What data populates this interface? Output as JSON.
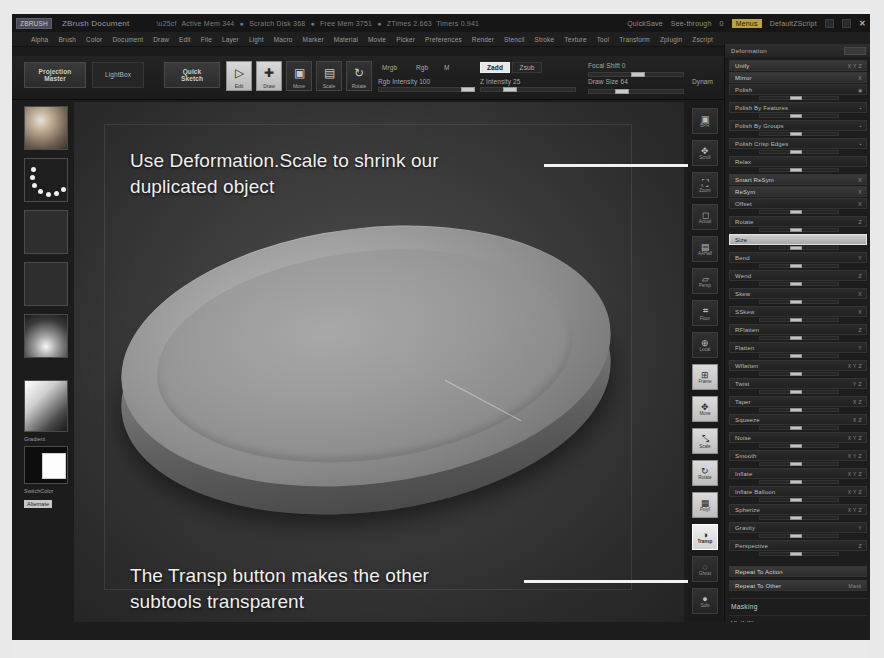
{
  "titlebar": {
    "badge": "ZBRUSH",
    "document": "ZBrush Document",
    "stats": [
      {
        "label": "Active Mem",
        "value": "344"
      },
      {
        "label": "Scratch Disk",
        "value": "368"
      },
      {
        "label": "Free Mem",
        "value": "3751"
      },
      {
        "label": "ZTimes",
        "value": "2.663"
      },
      {
        "label": "Timers",
        "value": "0.941"
      }
    ],
    "quicksave": "QuickSave",
    "see_through": "See-through",
    "see_through_value": "0",
    "menus_button": "Menus",
    "default_zscript": "DefaultZScript",
    "close": "✕"
  },
  "menubar": {
    "items": [
      "Alpha",
      "Brush",
      "Color",
      "Document",
      "Draw",
      "Edit",
      "File",
      "Layer",
      "Light",
      "Macro",
      "Marker",
      "Material",
      "Movie",
      "Picker",
      "Preferences",
      "Render",
      "Stencil",
      "Stroke",
      "Texture",
      "Tool",
      "Transform",
      "Zplugin",
      "Zscript"
    ],
    "subrow": "Size"
  },
  "toolbar": {
    "projection_master": "Projection\nMaster",
    "lightbox": "LightBox",
    "quick_sketch": "Quick\nSketch",
    "edit": "Edit",
    "draw": "Draw",
    "move": "Move",
    "scale": "Scale",
    "rotate": "Rotate",
    "mrgb": "Mrgb",
    "rgb": "Rgb",
    "m": "M",
    "zadd": "Zadd",
    "zsub": "Zsub",
    "rgb_intensity": "Rgb Intensity 100",
    "z_intensity": "Z Intensity 25",
    "focal_shift": "Focal Shift 0",
    "draw_size": "Draw Size 64",
    "dynamic": "Dynam",
    "active_points": "ActivePoints 1",
    "total_points": "TotalPoints 21"
  },
  "shelf": {
    "brush_label": "Standard",
    "stroke_label": "Dots",
    "alpha_label": "Alpha Off",
    "texture_label": "Texture Off",
    "material_label": "SkinShade4",
    "gradient_label": "Gradient",
    "switch_color_label": "SwitchColor",
    "alternate_label": "Alternate"
  },
  "annotations": [
    {
      "text": "Use Deformation.Scale to shrink our\nduplicated object",
      "target": "deformation-size-slider"
    },
    {
      "text": "The Transp button makes the other\nsubtools transparent",
      "target": "transp-button"
    }
  ],
  "rail": {
    "items": [
      {
        "label": "BPR",
        "icon": "render-icon"
      },
      {
        "label": "Scroll",
        "icon": "scroll-icon"
      },
      {
        "label": "Zoom",
        "icon": "zoom-icon"
      },
      {
        "label": "Actual",
        "icon": "actual-size-icon"
      },
      {
        "label": "AAHalf",
        "icon": "aahalf-icon"
      },
      {
        "label": "Persp",
        "icon": "perspective-icon"
      },
      {
        "label": "Floor",
        "icon": "floor-grid-icon"
      },
      {
        "label": "Local",
        "icon": "local-icon"
      },
      {
        "label": "Frame",
        "icon": "frame-icon"
      },
      {
        "label": "Move",
        "icon": "move-icon"
      },
      {
        "label": "Scale",
        "icon": "scale-icon"
      },
      {
        "label": "Rotate",
        "icon": "rotate-icon"
      },
      {
        "label": "Polyf",
        "icon": "polyframe-icon"
      },
      {
        "label": "Transp",
        "icon": "transparency-icon"
      },
      {
        "label": "Ghost",
        "icon": "ghost-icon"
      },
      {
        "label": "Solo",
        "icon": "solo-icon"
      }
    ],
    "active": "Transp"
  },
  "palette": {
    "title": "Deformation",
    "rows": [
      {
        "label": "Unify",
        "suffix": "X Y Z",
        "slider": false,
        "style": "bold"
      },
      {
        "label": "Mirror",
        "suffix": "X",
        "slider": false,
        "style": "bold"
      },
      {
        "label": "Polish",
        "suffix": "◉",
        "slider": true,
        "style": "normal"
      },
      {
        "label": "Polish By Features",
        "suffix": "▪",
        "slider": true,
        "style": "normal"
      },
      {
        "label": "Polish By Groups",
        "suffix": "▪",
        "slider": true,
        "style": "normal"
      },
      {
        "label": "Polish Crisp Edges",
        "suffix": "▪",
        "slider": true,
        "style": "normal"
      },
      {
        "label": "Relax",
        "suffix": "",
        "slider": true,
        "style": "normal"
      },
      {
        "label": "Smart ReSym",
        "suffix": "X",
        "slider": false,
        "style": "bold"
      },
      {
        "label": "ReSym",
        "suffix": "X",
        "slider": false,
        "style": "bold"
      },
      {
        "label": "Offset",
        "suffix": "X",
        "slider": true,
        "style": "normal"
      },
      {
        "label": "Rotate",
        "suffix": "Z",
        "slider": true,
        "style": "normal"
      },
      {
        "label": "Size",
        "suffix": "",
        "slider": true,
        "style": "sel"
      },
      {
        "label": "Bend",
        "suffix": "Y",
        "slider": true,
        "style": "normal"
      },
      {
        "label": "Wend",
        "suffix": "Z",
        "slider": true,
        "style": "normal"
      },
      {
        "label": "Skew",
        "suffix": "X",
        "slider": true,
        "style": "normal"
      },
      {
        "label": "SSkew",
        "suffix": "X",
        "slider": true,
        "style": "normal"
      },
      {
        "label": "RFlatten",
        "suffix": "Z",
        "slider": true,
        "style": "normal"
      },
      {
        "label": "Flatten",
        "suffix": "Y",
        "slider": true,
        "style": "normal"
      },
      {
        "label": "Wflatten",
        "suffix": "X Y Z",
        "slider": true,
        "style": "normal"
      },
      {
        "label": "Twist",
        "suffix": "Y Z",
        "slider": true,
        "style": "normal"
      },
      {
        "label": "Taper",
        "suffix": "X Z",
        "slider": true,
        "style": "normal"
      },
      {
        "label": "Squeeze",
        "suffix": "X Z",
        "slider": true,
        "style": "normal"
      },
      {
        "label": "Noise",
        "suffix": "X Y Z",
        "slider": true,
        "style": "normal"
      },
      {
        "label": "Smooth",
        "suffix": "X Y Z",
        "slider": true,
        "style": "normal"
      },
      {
        "label": "Inflate",
        "suffix": "X Y Z",
        "slider": true,
        "style": "normal"
      },
      {
        "label": "Inflate Balloon",
        "suffix": "X Y Z",
        "slider": true,
        "style": "normal"
      },
      {
        "label": "Spherize",
        "suffix": "X Y Z",
        "slider": true,
        "style": "normal"
      },
      {
        "label": "Gravity",
        "suffix": "Y",
        "slider": true,
        "style": "normal"
      },
      {
        "label": "Perspective",
        "suffix": "Z",
        "slider": true,
        "style": "normal"
      }
    ],
    "repeat_to_action": "Repeat To Action",
    "repeat_to_other": "Repeat To Other",
    "repeat_mask": "Mask",
    "sections": [
      "Masking",
      "Visibility",
      "Polygroups",
      "Contact",
      "Morph Target",
      "Polypaint",
      "UV Map",
      "Texture Map"
    ]
  },
  "colors": {
    "accent": "#b8a43a",
    "panel_bg": "#1d1d1d",
    "selected": "#cfcfcf",
    "text": "#b9b9b9"
  }
}
